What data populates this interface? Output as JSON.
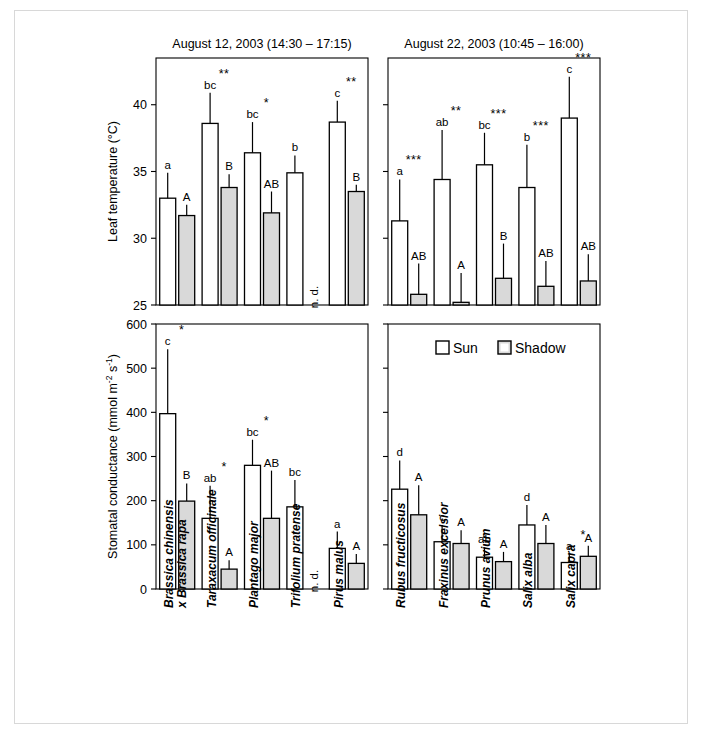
{
  "figure": {
    "panels": {
      "top_left_title": "August 12, 2003 (14:30 – 17:15)",
      "top_right_title": "August 22, 2003 (10:45 – 16:00)"
    },
    "legend": {
      "sun_label": "Sun",
      "shadow_label": "Shadow"
    },
    "not_determined_label": "n. d.",
    "colors": {
      "sun_fill": "#ffffff",
      "shadow_fill": "#d9d9d9",
      "line": "#000000",
      "border": "#d8d8d8"
    }
  },
  "chart_data": [
    {
      "id": "leaf-temp-aug12",
      "type": "bar",
      "title": "August 12, 2003 (14:30 – 17:15)",
      "ylabel": "Leaf temperature (°C)",
      "xlabel": "",
      "ylim": [
        25,
        43.5
      ],
      "yticks": [
        25,
        30,
        35,
        40
      ],
      "grid": false,
      "legend_position": "none",
      "categories": [
        "Brassica chinensis x Brassica rapa",
        "Taraxacum officinale",
        "Plantago major",
        "Trifolium pratense",
        "Pirus malus"
      ],
      "series": [
        {
          "name": "Sun",
          "values": [
            33.0,
            38.6,
            36.4,
            34.9,
            38.7
          ],
          "errors": [
            1.9,
            2.3,
            2.3,
            1.3,
            1.6
          ],
          "letters": [
            "a",
            "bc",
            "bc",
            "b",
            "c"
          ]
        },
        {
          "name": "Shadow",
          "values": [
            31.7,
            33.8,
            31.9,
            null,
            33.5
          ],
          "errors": [
            0.8,
            1.0,
            1.6,
            null,
            0.5
          ],
          "letters": [
            "A",
            "B",
            "AB",
            null,
            "B"
          ]
        }
      ],
      "significance": [
        "",
        "**",
        "*",
        "",
        "**"
      ]
    },
    {
      "id": "leaf-temp-aug22",
      "type": "bar",
      "title": "August 22, 2003 (10:45 – 16:00)",
      "ylabel": "Leaf temperature (°C)",
      "xlabel": "",
      "ylim": [
        25,
        43.5
      ],
      "yticks": [
        25,
        30,
        35,
        40
      ],
      "grid": false,
      "legend_position": "none",
      "categories": [
        "Rubus fructicosus",
        "Fraxinus excelsior",
        "Prunus avium",
        "Salix alba",
        "Salix capra"
      ],
      "series": [
        {
          "name": "Sun",
          "values": [
            31.3,
            34.4,
            35.5,
            33.8,
            39.0
          ],
          "errors": [
            3.1,
            3.7,
            2.4,
            3.2,
            3.1
          ],
          "letters": [
            "a",
            "ab",
            "bc",
            "b",
            "c"
          ]
        },
        {
          "name": "Shadow",
          "values": [
            25.8,
            25.2,
            27.0,
            26.4,
            26.8
          ],
          "errors": [
            2.3,
            2.2,
            2.6,
            1.9,
            2.0
          ],
          "letters": [
            "AB",
            "A",
            "B",
            "AB",
            "AB"
          ]
        }
      ],
      "significance": [
        "***",
        "**",
        "***",
        "***",
        "***"
      ]
    },
    {
      "id": "stomatal-conductance-aug12",
      "type": "bar",
      "title": "",
      "ylabel": "Stomatal conductance (mmol m⁻² s⁻¹)",
      "xlabel": "",
      "ylim": [
        0,
        600
      ],
      "yticks": [
        0,
        100,
        200,
        300,
        400,
        500,
        600
      ],
      "grid": false,
      "legend_position": "none",
      "categories": [
        "Brassica chinensis x Brassica rapa",
        "Taraxacum officinale",
        "Plantago major",
        "Trifolium pratense",
        "Pirus malus"
      ],
      "series": [
        {
          "name": "Sun",
          "values": [
            397,
            160,
            280,
            186,
            92
          ],
          "errors": [
            146,
            74,
            58,
            61,
            38
          ],
          "letters": [
            "c",
            "ab",
            "bc",
            "bc",
            "a"
          ]
        },
        {
          "name": "Shadow",
          "values": [
            199,
            45,
            160,
            null,
            58
          ],
          "errors": [
            40,
            20,
            108,
            null,
            21
          ],
          "letters": [
            "B",
            "A",
            "AB",
            null,
            "A"
          ]
        }
      ],
      "significance": [
        "*",
        "*",
        "*",
        "",
        ""
      ]
    },
    {
      "id": "stomatal-conductance-aug22",
      "type": "bar",
      "title": "",
      "ylabel": "Stomatal conductance (mmol m⁻² s⁻¹)",
      "xlabel": "",
      "ylim": [
        0,
        600
      ],
      "yticks": [
        0,
        100,
        200,
        300,
        400,
        500,
        600
      ],
      "grid": false,
      "legend_position": "top",
      "categories": [
        "Rubus fructicosus",
        "Fraxinus excelsior",
        "Prunus avium",
        "Salix alba",
        "Salix capra"
      ],
      "series": [
        {
          "name": "Sun",
          "values": [
            226,
            107,
            72,
            145,
            60
          ],
          "errors": [
            65,
            38,
            22,
            45,
            20
          ],
          "letters": [
            "d",
            "c",
            "ab",
            "d",
            "a"
          ]
        },
        {
          "name": "Shadow",
          "values": [
            168,
            103,
            62,
            103,
            74
          ],
          "errors": [
            67,
            30,
            22,
            42,
            24
          ],
          "letters": [
            "A",
            "A",
            "A",
            "A",
            "A"
          ]
        }
      ],
      "significance": [
        "",
        "",
        "",
        "",
        "*"
      ]
    }
  ],
  "species_labels_left": [
    [
      "Brassica chinensis",
      "x Brassica rapa"
    ],
    [
      "Taraxacum officinale"
    ],
    [
      "Plantago major"
    ],
    [
      "Trifolium pratense"
    ],
    [
      "Pirus malus"
    ]
  ],
  "species_labels_right": [
    [
      "Rubus fructicosus"
    ],
    [
      "Fraxinus excelsior"
    ],
    [
      "Prunus avium"
    ],
    [
      "Salix alba"
    ],
    [
      "Salix capra"
    ]
  ],
  "axis_titles": {
    "top": "Leaf temperature (°C)",
    "bottom_main": "Stomatal conductance  (mmol m",
    "bottom_sup1": "-2",
    "bottom_mid": " s",
    "bottom_sup2": "-1",
    "bottom_end": ")"
  }
}
